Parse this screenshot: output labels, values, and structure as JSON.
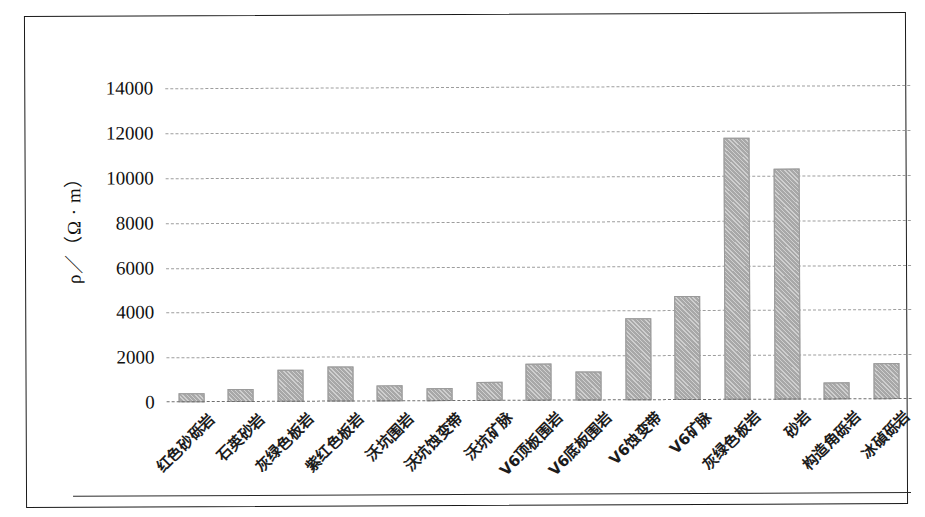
{
  "figure": {
    "y_axis_title": "ρ／（Ω · m）",
    "bar_color": "#a8a8a8",
    "gridline_color": "#8d8d8d",
    "frame_color": "#1a1a1a"
  },
  "chart_data": {
    "type": "bar",
    "title": "",
    "xlabel": "",
    "ylabel": "ρ／（Ω · m）",
    "ylim": [
      0,
      15000
    ],
    "ytick_labels": [
      "14000",
      "12000",
      "10000",
      "8000",
      "6000",
      "4000",
      "2000",
      "0"
    ],
    "ytick_values": [
      14000,
      12000,
      10000,
      8000,
      6000,
      4000,
      2000,
      0
    ],
    "grid": true,
    "grid_style": "dashed-horizontal",
    "legend": false,
    "categories": [
      "红色砂砾岩",
      "石英砂岩",
      "灰绿色板岩",
      "紫红色板岩",
      "沃坑围岩",
      "沃坑蚀变带",
      "沃坑矿脉",
      "V6顶板围岩",
      "V6底板围岩",
      "V6蚀变带",
      "V6矿脉",
      "灰绿色板岩",
      "砂岩",
      "构造角砾岩",
      "冰碵砾岩"
    ],
    "values": [
      400,
      600,
      1450,
      1550,
      700,
      560,
      830,
      1650,
      1280,
      3650,
      4650,
      11700,
      10300,
      740,
      1620
    ]
  }
}
